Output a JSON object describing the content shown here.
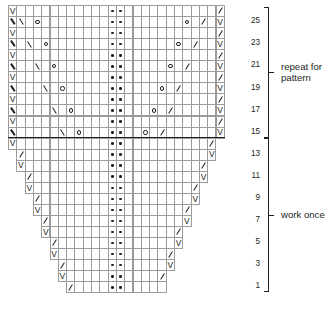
{
  "chart": {
    "type": "knitting-chart",
    "columns": 26,
    "rows": 26,
    "cell_width": 8.3,
    "cell_height": 11.05,
    "origin_x": 8,
    "origin_y": 5,
    "grid_color": "#9b9b9b",
    "symbol_color": "#231f20",
    "background": "#ffffff",
    "separator_after_row": 15,
    "symbol_legend": {
      "v": "slip-stitch-or-knit-through-back",
      "o": "yarn-over",
      "dot": "purl",
      "bs": "left-leaning-decrease",
      "fs": "right-leaning-decrease",
      "bsb": "bold-left-leaning-decrease"
    },
    "center_purl_columns": [
      12,
      13
    ],
    "rows_data": [
      {
        "row": 26,
        "label": "",
        "start": 0,
        "end": 25,
        "cells": {
          "0": "v",
          "12": "dot",
          "13": "dot",
          "25": "fs"
        }
      },
      {
        "row": 25,
        "label": "25",
        "start": 0,
        "end": 25,
        "cells": {
          "0": "bsb",
          "1": "bs",
          "3": "o",
          "12": "dot",
          "13": "dot",
          "21": "o",
          "23": "fs",
          "25": "v"
        }
      },
      {
        "row": 24,
        "label": "",
        "start": 0,
        "end": 25,
        "cells": {
          "0": "v",
          "12": "dot",
          "13": "dot",
          "25": "fs"
        }
      },
      {
        "row": 23,
        "label": "23",
        "start": 0,
        "end": 25,
        "cells": {
          "0": "bsb",
          "2": "bs",
          "4": "o",
          "12": "dot",
          "13": "dot",
          "20": "o",
          "22": "fs",
          "25": "v"
        }
      },
      {
        "row": 22,
        "label": "",
        "start": 0,
        "end": 25,
        "cells": {
          "0": "v",
          "12": "dot",
          "13": "dot",
          "25": "fs"
        }
      },
      {
        "row": 21,
        "label": "21",
        "start": 0,
        "end": 25,
        "cells": {
          "0": "bsb",
          "3": "bs",
          "5": "o",
          "12": "dot",
          "13": "dot",
          "19": "o",
          "21": "fs",
          "25": "v"
        }
      },
      {
        "row": 20,
        "label": "",
        "start": 0,
        "end": 25,
        "cells": {
          "0": "v",
          "12": "dot",
          "13": "dot",
          "25": "fs"
        }
      },
      {
        "row": 19,
        "label": "19",
        "start": 0,
        "end": 25,
        "cells": {
          "0": "bsb",
          "4": "bs",
          "6": "o",
          "12": "dot",
          "13": "dot",
          "18": "o",
          "20": "fs",
          "25": "v"
        }
      },
      {
        "row": 18,
        "label": "",
        "start": 0,
        "end": 25,
        "cells": {
          "0": "v",
          "12": "dot",
          "13": "dot",
          "25": "fs"
        }
      },
      {
        "row": 17,
        "label": "17",
        "start": 0,
        "end": 25,
        "cells": {
          "0": "bsb",
          "5": "bs",
          "7": "o",
          "12": "dot",
          "13": "dot",
          "17": "o",
          "19": "fs",
          "25": "v"
        }
      },
      {
        "row": 16,
        "label": "",
        "start": 0,
        "end": 25,
        "cells": {
          "0": "v",
          "12": "dot",
          "13": "dot",
          "25": "fs"
        }
      },
      {
        "row": 15,
        "label": "15",
        "start": 0,
        "end": 25,
        "cells": {
          "0": "bsb",
          "6": "bs",
          "8": "o",
          "12": "dot",
          "13": "dot",
          "16": "o",
          "18": "fs",
          "25": "v"
        }
      },
      {
        "row": 14,
        "label": "",
        "start": 0,
        "end": 24,
        "cells": {
          "0": "v",
          "12": "dot",
          "13": "dot",
          "24": "fs"
        }
      },
      {
        "row": 13,
        "label": "13",
        "start": 1,
        "end": 24,
        "cells": {
          "1": "fs",
          "12": "dot",
          "13": "dot",
          "24": "v"
        }
      },
      {
        "row": 12,
        "label": "",
        "start": 1,
        "end": 23,
        "cells": {
          "1": "v",
          "12": "dot",
          "13": "dot",
          "23": "fs"
        }
      },
      {
        "row": 11,
        "label": "11",
        "start": 2,
        "end": 23,
        "cells": {
          "2": "fs",
          "12": "dot",
          "13": "dot",
          "23": "v"
        }
      },
      {
        "row": 10,
        "label": "",
        "start": 2,
        "end": 22,
        "cells": {
          "2": "v",
          "12": "dot",
          "13": "dot",
          "22": "fs"
        }
      },
      {
        "row": 9,
        "label": "9",
        "start": 3,
        "end": 22,
        "cells": {
          "3": "fs",
          "12": "dot",
          "13": "dot",
          "22": "v"
        }
      },
      {
        "row": 8,
        "label": "",
        "start": 3,
        "end": 21,
        "cells": {
          "3": "v",
          "12": "dot",
          "13": "dot",
          "21": "fs"
        }
      },
      {
        "row": 7,
        "label": "7",
        "start": 4,
        "end": 21,
        "cells": {
          "4": "fs",
          "12": "dot",
          "13": "dot",
          "21": "v"
        }
      },
      {
        "row": 6,
        "label": "",
        "start": 4,
        "end": 20,
        "cells": {
          "4": "v",
          "12": "dot",
          "13": "dot",
          "20": "fs"
        }
      },
      {
        "row": 5,
        "label": "5",
        "start": 5,
        "end": 20,
        "cells": {
          "5": "fs",
          "12": "dot",
          "13": "dot",
          "20": "v"
        }
      },
      {
        "row": 4,
        "label": "",
        "start": 5,
        "end": 19,
        "cells": {
          "5": "v",
          "12": "dot",
          "13": "dot",
          "19": "fs"
        }
      },
      {
        "row": 3,
        "label": "3",
        "start": 6,
        "end": 19,
        "cells": {
          "6": "fs",
          "12": "dot",
          "13": "dot",
          "19": "v"
        }
      },
      {
        "row": 2,
        "label": "",
        "start": 6,
        "end": 18,
        "cells": {
          "6": "v",
          "12": "dot",
          "13": "dot",
          "18": "fs"
        }
      },
      {
        "row": 1,
        "label": "1",
        "start": 7,
        "end": 18,
        "cells": {
          "7": "fs",
          "12": "dot",
          "13": "dot"
        }
      }
    ]
  },
  "annotations": {
    "repeat_bracket": {
      "label": "repeat for\npattern",
      "from_row": 15,
      "to_row": 26
    },
    "work_once_bracket": {
      "label": "work once",
      "from_row": 1,
      "to_row": 14
    }
  }
}
